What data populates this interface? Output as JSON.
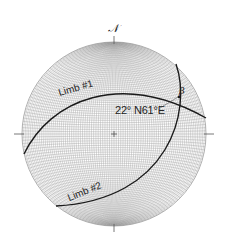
{
  "diagram": {
    "type": "stereonet",
    "net": "equal-area (Schmidt) net, lower hemisphere",
    "north_label": "N",
    "center": [
      114,
      134
    ],
    "radius": 92,
    "grid_color": "#9a9a9a",
    "line_color": "#1a1a1a"
  },
  "labels": {
    "north": "𝒩",
    "beta": "β",
    "fold_axis": "22° N61°E",
    "limb1": "Limb #1",
    "limb2": "Limb #2"
  },
  "features": [
    {
      "name": "Limb #1",
      "kind": "great-circle"
    },
    {
      "name": "Limb #2",
      "kind": "great-circle"
    },
    {
      "name": "β",
      "kind": "intersection point",
      "trend_plunge": "22° N61°E"
    }
  ]
}
